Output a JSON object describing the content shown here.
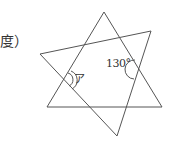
{
  "text": {
    "unit_label": "度）",
    "angle_given": "130°",
    "angle_unknown": "ア"
  },
  "figure": {
    "stroke_color": "#555555",
    "triangle_upright": [
      [
        104,
        12
      ],
      [
        47,
        107
      ],
      [
        162,
        107
      ]
    ],
    "triangle_slanted": [
      [
        40,
        54
      ],
      [
        151,
        31
      ],
      [
        117,
        136
      ]
    ],
    "marked_angles": [
      {
        "label": "130°",
        "vertex": [
          138,
          70
        ],
        "arcs": 1
      },
      {
        "label": "ア",
        "vertex": [
          64,
          80
        ],
        "arcs": 2
      }
    ]
  }
}
